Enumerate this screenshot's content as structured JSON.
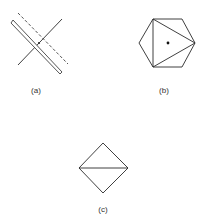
{
  "figures": [
    {
      "id": "a",
      "label": "(a)",
      "description": "Two crossing lines with a dashed line and an elongated wedge through the intersection"
    },
    {
      "id": "b",
      "label": "(b)",
      "description": "Hexagon with inscribed triangle and center dot"
    },
    {
      "id": "c",
      "label": "(c)",
      "description": "Square rotated 45 degrees (diamond) divided by a horizontal diagonal"
    }
  ],
  "colors": {
    "stroke": "#2a2a2a",
    "label": "#333333",
    "background": "#ffffff"
  }
}
